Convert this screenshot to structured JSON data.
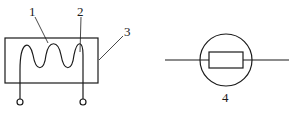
{
  "diagram": {
    "left_component": {
      "labels": [
        {
          "id": "1",
          "text": "1"
        },
        {
          "id": "2",
          "text": "2"
        },
        {
          "id": "3",
          "text": "3"
        }
      ]
    },
    "right_component": {
      "label": "4"
    },
    "colors": {
      "stroke": "#1a1a1a",
      "background": "#ffffff"
    }
  }
}
